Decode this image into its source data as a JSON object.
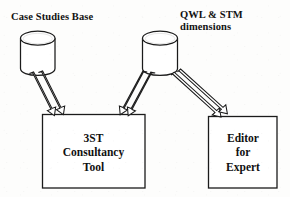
{
  "diagram": {
    "type": "block-diagram",
    "canvas": {
      "width": 290,
      "height": 197,
      "background": "#fdfdfc"
    },
    "stroke_color": "#1a1a1a",
    "fill_color": "#ffffff",
    "labels": {
      "case_studies_base": "Case Studies Base",
      "qwl_stm_dimensions": "QWL & STM\ndimensions"
    },
    "nodes": [
      {
        "id": "case-studies-base-store",
        "shape": "cylinder",
        "label": "Case Studies Base",
        "x": 20,
        "y": 31,
        "width": 35,
        "height": 44
      },
      {
        "id": "qwl-stm-dimensions-store",
        "shape": "cylinder",
        "label": "QWL & STM dimensions",
        "x": 142,
        "y": 31,
        "width": 36,
        "height": 44
      },
      {
        "id": "consultancy-tool-box",
        "shape": "rectangle",
        "label": "3ST\nConsultancy\nTool",
        "x": 42,
        "y": 114,
        "width": 103,
        "height": 74
      },
      {
        "id": "editor-for-expert-box",
        "shape": "rectangle",
        "label": "Editor\nfor\nExpert",
        "x": 208,
        "y": 116,
        "width": 69,
        "height": 72
      }
    ],
    "connectors": [
      {
        "id": "case-studies-to-tool",
        "style": "hollow-block-arrow-pair",
        "from": "case-studies-base-store",
        "to": "consultancy-tool-box",
        "direction": "down-right",
        "count": 2
      },
      {
        "id": "qwl-stm-to-tool",
        "style": "hollow-block-arrow-pair",
        "from": "qwl-stm-dimensions-store",
        "to": "consultancy-tool-box",
        "direction": "down-left",
        "count": 2
      },
      {
        "id": "qwl-stm-to-editor",
        "style": "hollow-block-arrow-pair",
        "from": "qwl-stm-dimensions-store",
        "to": "editor-for-expert-box",
        "direction": "down-right",
        "count": 2
      }
    ]
  }
}
